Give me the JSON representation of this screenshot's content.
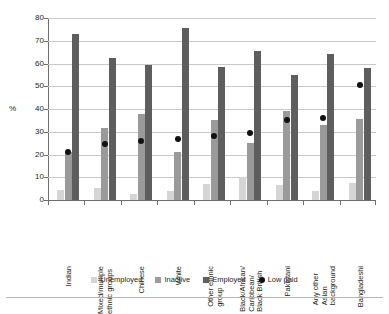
{
  "chart_data": {
    "type": "bar",
    "title": "",
    "subtitle": "",
    "xlabel": "",
    "ylabel": "%",
    "ylim": [
      0,
      80
    ],
    "yticks": [
      0,
      10,
      20,
      30,
      40,
      50,
      60,
      70,
      80
    ],
    "grid": true,
    "legend_position": "bottom",
    "categories": [
      "Indian",
      "Mixed/multiple\nethnic groups",
      "Chinese",
      "White",
      "Other ethnic\ngroup",
      "Black/African/\nCaribbean/\nBlack British",
      "Pakistani",
      "Any other\nAsian\nbackground",
      "Bangladeshi"
    ],
    "series": [
      {
        "name": "Unemployed",
        "type": "bar",
        "color": "#d5d5d5",
        "values": [
          4.5,
          5.5,
          2.5,
          4.0,
          7.0,
          10.0,
          6.5,
          4.0,
          7.5
        ]
      },
      {
        "name": "Inactive",
        "type": "bar",
        "color": "#9a9a9a",
        "values": [
          21.0,
          31.5,
          38.0,
          21.0,
          35.0,
          25.0,
          39.0,
          33.0,
          35.5
        ]
      },
      {
        "name": "Employed",
        "type": "bar",
        "color": "#5e5e5e",
        "values": [
          73.0,
          62.5,
          59.5,
          75.5,
          58.5,
          65.5,
          55.0,
          64.0,
          58.0
        ]
      },
      {
        "name": "Low paid",
        "type": "scatter",
        "color": "#111111",
        "values": [
          21.0,
          24.5,
          26.0,
          27.0,
          28.0,
          29.5,
          35.0,
          36.0,
          50.5
        ]
      }
    ]
  },
  "legend": {
    "items": [
      {
        "label": "Unemployed",
        "color": "#d5d5d5",
        "marker": "square"
      },
      {
        "label": "Inactive",
        "color": "#9a9a9a",
        "marker": "square"
      },
      {
        "label": "Employed",
        "color": "#5e5e5e",
        "marker": "square"
      },
      {
        "label": "Low paid",
        "color": "#111111",
        "marker": "circle"
      }
    ]
  }
}
